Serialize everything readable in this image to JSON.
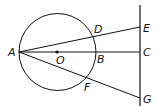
{
  "diagram": {
    "type": "geometry",
    "stroke_color": "#111111",
    "circle": {
      "center_label": "O",
      "cx": 57.5,
      "cy": 52,
      "r": 38.5
    },
    "vertical_line": {
      "x": 140,
      "y1": 5,
      "y2": 106
    },
    "points": {
      "A": {
        "label": "A",
        "x": 19,
        "y": 52
      },
      "O": {
        "label": "O",
        "x": 57,
        "y": 52
      },
      "B": {
        "label": "B",
        "x": 96,
        "y": 52
      },
      "D": {
        "label": "D",
        "x": 93,
        "y": 37
      },
      "F": {
        "label": "F",
        "x": 87,
        "y": 77
      },
      "E": {
        "label": "E",
        "x": 140,
        "y": 27
      },
      "C": {
        "label": "C",
        "x": 140,
        "y": 52
      },
      "G": {
        "label": "G",
        "x": 140,
        "y": 98
      }
    },
    "segments": [
      "AE",
      "AC",
      "AG",
      "EG"
    ]
  }
}
